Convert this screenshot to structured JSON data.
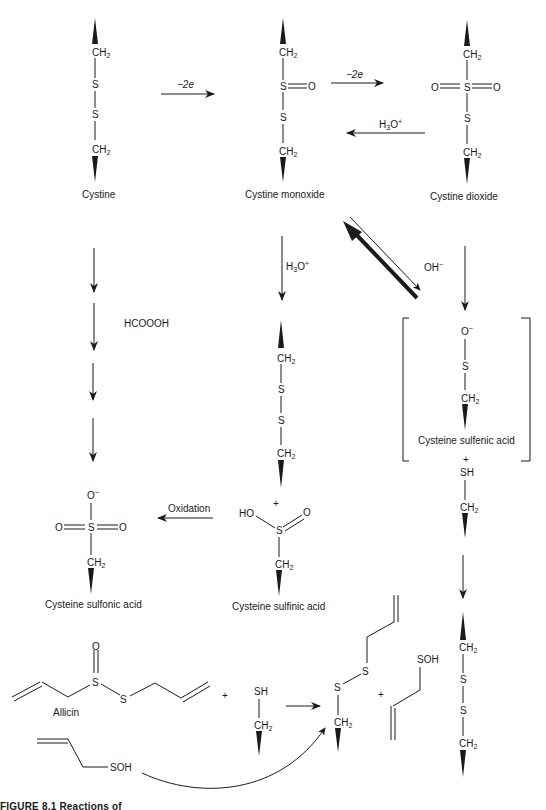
{
  "figure": {
    "caption": "FIGURE 8.1  Reactions of",
    "compounds": {
      "cystine": "Cystine",
      "cystine_monoxide": "Cystine monoxide",
      "cystine_dioxide": "Cystine dioxide",
      "cysteine_sulfenic_acid": "Cysteine sulfenic acid",
      "cysteine_sulfinic_acid": "Cysteine sulfinic acid",
      "cysteine_sulfonic_acid": "Cysteine sulfonic acid",
      "allicin": "Allicin"
    },
    "reagents": {
      "minus_2e_1": "−2e",
      "minus_2e_2": "−2e",
      "h3o_back": "H3O+",
      "h3o_down": "H3O+",
      "oh_minus": "OH−",
      "hcoooh": "HCOOOH",
      "oxidation": "Oxidation"
    },
    "atoms": {
      "ch2": "CH",
      "sub2": "2",
      "s": "S",
      "o": "O",
      "o_minus": "O",
      "minus": "−",
      "plus": "+",
      "sh": "SH",
      "ho": "HO",
      "soh": "SOH",
      "h3o_base": "H",
      "h3o_3": "3",
      "h3o_o": "O",
      "h3o_plus": "+"
    }
  }
}
